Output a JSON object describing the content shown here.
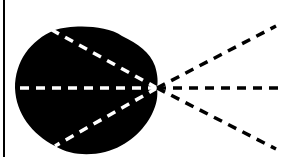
{
  "diagram": {
    "type": "radiation-pattern",
    "colors": {
      "background": "#ffffff",
      "blob": "#000000",
      "inner_dash": "#ffffff",
      "outer_dash": "#000000",
      "border": "#000000"
    },
    "origin": {
      "x": 157,
      "y": 88
    },
    "inner_lines": [
      {
        "name": "inner-ray-upper",
        "to": {
          "x": 52,
          "y": 30
        }
      },
      {
        "name": "inner-ray-center",
        "to": {
          "x": 15,
          "y": 88
        }
      },
      {
        "name": "inner-ray-lower",
        "to": {
          "x": 55,
          "y": 146
        }
      }
    ],
    "outer_lines": [
      {
        "name": "outer-ray-upper",
        "to": {
          "x": 276,
          "y": 26
        }
      },
      {
        "name": "outer-ray-center",
        "to": {
          "x": 285,
          "y": 88
        }
      },
      {
        "name": "outer-ray-lower",
        "to": {
          "x": 276,
          "y": 149
        }
      }
    ]
  }
}
